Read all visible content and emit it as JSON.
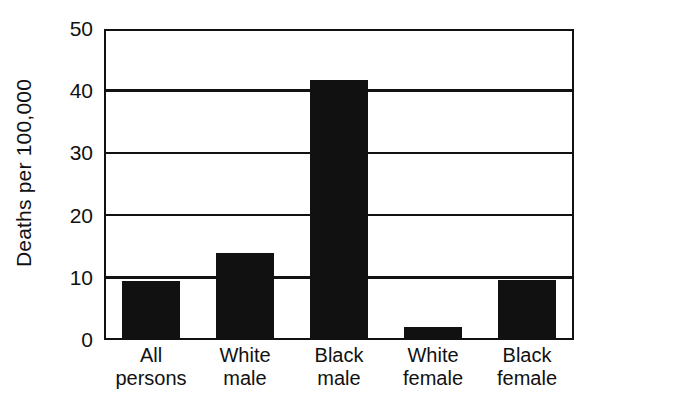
{
  "chart_data": {
    "type": "bar",
    "title": "",
    "xlabel": "",
    "ylabel": "Deaths per 100,000",
    "ylim": [
      0,
      50
    ],
    "yticks": [
      0,
      10,
      20,
      30,
      40,
      50
    ],
    "ytick_labels": [
      "0",
      "10",
      "20",
      "30",
      "40",
      "50"
    ],
    "grid": true,
    "legend": false,
    "bar_color": "#111111",
    "axis_color": "#111111",
    "background": "#ffffff",
    "categories": [
      "All persons",
      "White male",
      "Black male",
      "White female",
      "Black female"
    ],
    "category_lines": [
      [
        "All",
        "persons"
      ],
      [
        "White",
        "male"
      ],
      [
        "Black",
        "male"
      ],
      [
        "White",
        "female"
      ],
      [
        "Black",
        "female"
      ]
    ],
    "values": [
      9.2,
      13.6,
      41.5,
      1.8,
      9.3
    ]
  }
}
